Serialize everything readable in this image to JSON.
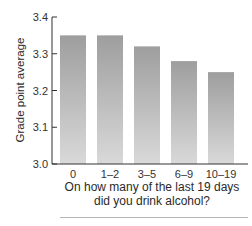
{
  "chart_data": {
    "type": "bar",
    "title": "",
    "xlabel_line1": "On how many of the last 19 days",
    "xlabel_line2": "did you drink alcohol?",
    "ylabel": "Grade point average",
    "categories": [
      "0",
      "1–2",
      "3–5",
      "6–9",
      "10–19"
    ],
    "values": [
      3.35,
      3.35,
      3.32,
      3.28,
      3.25
    ],
    "ylim": [
      3.0,
      3.4
    ],
    "yticks": [
      "3.0",
      "3.1",
      "3.2",
      "3.3",
      "3.4"
    ],
    "grid": false,
    "legend": null,
    "bar_color_top": "#9e9e9e",
    "bar_color_bottom": "#d9d9d9"
  }
}
